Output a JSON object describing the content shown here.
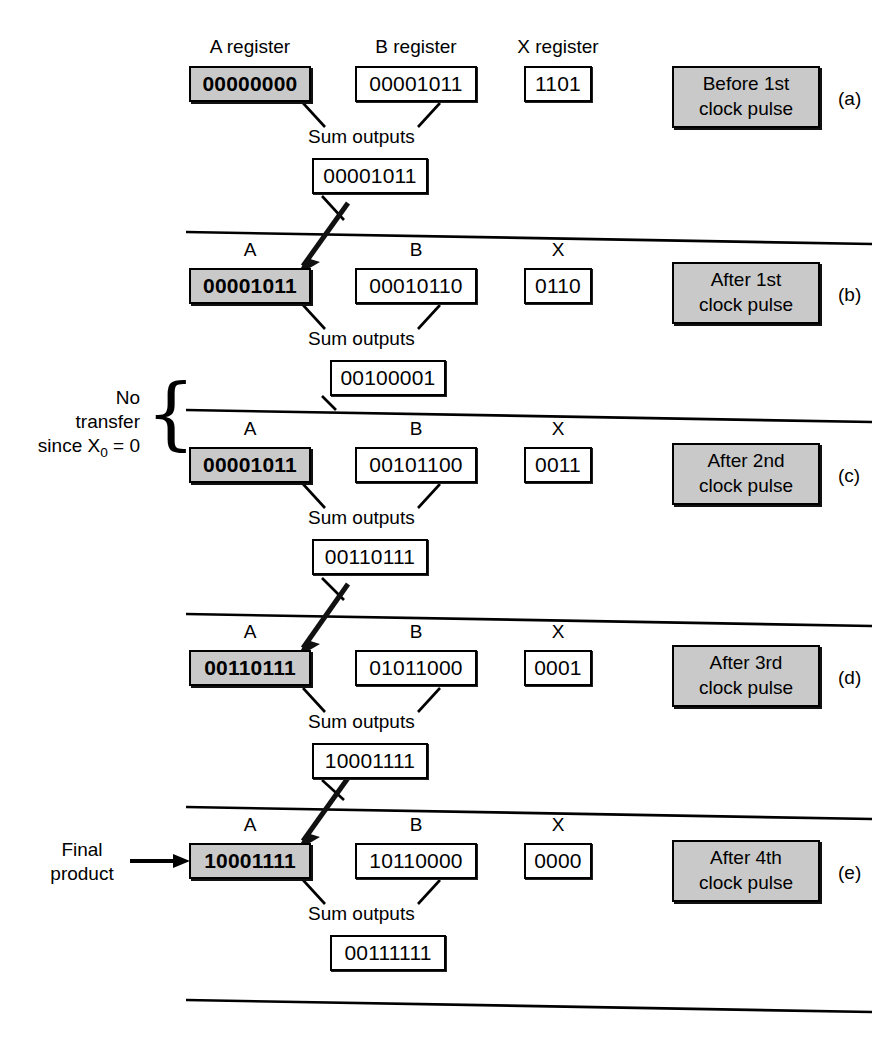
{
  "figure": {
    "title_top_captions": [
      "A register",
      "B register",
      "X register"
    ],
    "sum_label": "Sum outputs",
    "short_captions": [
      "A",
      "B",
      "X"
    ],
    "colors": {
      "shaded_fill": "#c9c9c9",
      "line": "#000000",
      "background": "#ffffff"
    }
  },
  "annotations": {
    "no_transfer": {
      "line1": "No",
      "line2": "transfer",
      "line3_pre": "since X",
      "line3_sub": "0",
      "line3_post": " = 0",
      "brace": "{"
    },
    "final_product": {
      "line1": "Final",
      "line2": "product",
      "arrow": "→"
    }
  },
  "steps": [
    {
      "tag": "(a)",
      "phase_line1": "Before 1st",
      "phase_line2": "clock pulse",
      "a_caption": "A register",
      "b_caption": "B register",
      "x_caption": "X register",
      "a_value": "00000000",
      "b_value": "00001011",
      "x_value": "1101",
      "sum_value": "00001011",
      "has_transfer_arrow": false
    },
    {
      "tag": "(b)",
      "phase_line1": "After 1st",
      "phase_line2": "clock pulse",
      "a_caption": "A",
      "b_caption": "B",
      "x_caption": "X",
      "a_value": "00001011",
      "b_value": "00010110",
      "x_value": "0110",
      "sum_value": "00100001",
      "has_transfer_arrow": true
    },
    {
      "tag": "(c)",
      "phase_line1": "After 2nd",
      "phase_line2": "clock pulse",
      "a_caption": "A",
      "b_caption": "B",
      "x_caption": "X",
      "a_value": "00001011",
      "b_value": "00101100",
      "x_value": "0011",
      "sum_value": "00110111",
      "has_transfer_arrow": false
    },
    {
      "tag": "(d)",
      "phase_line1": "After 3rd",
      "phase_line2": "clock pulse",
      "a_caption": "A",
      "b_caption": "B",
      "x_caption": "X",
      "a_value": "00110111",
      "b_value": "01011000",
      "x_value": "0001",
      "sum_value": "10001111",
      "has_transfer_arrow": true
    },
    {
      "tag": "(e)",
      "phase_line1": "After 4th",
      "phase_line2": "clock pulse",
      "a_caption": "A",
      "b_caption": "B",
      "x_caption": "X",
      "a_value": "10001111",
      "b_value": "10110000",
      "x_value": "0000",
      "sum_value": "00111111",
      "has_transfer_arrow": true
    }
  ]
}
